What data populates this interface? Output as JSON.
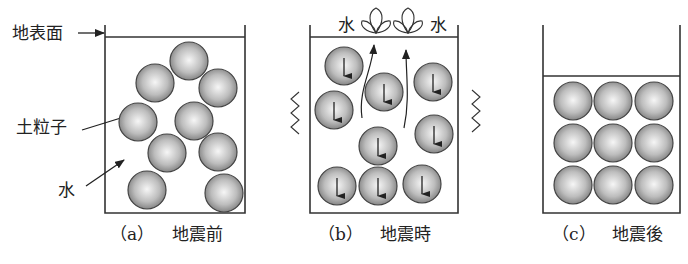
{
  "panels": {
    "a": {
      "caption_letter": "（a）",
      "caption_text": "地震前",
      "labels": {
        "ground_surface": "地表面",
        "soil_particle": "土粒子",
        "water": "水"
      }
    },
    "b": {
      "caption_letter": "（b）",
      "caption_text": "地震時",
      "labels": {
        "water_left": "水",
        "water_right": "水"
      }
    },
    "c": {
      "caption_letter": "（c）",
      "caption_text": "地震後"
    }
  },
  "colors": {
    "line": "#333333",
    "particle_light": "#f4f4f4",
    "particle_dark": "#8a8a8a"
  }
}
